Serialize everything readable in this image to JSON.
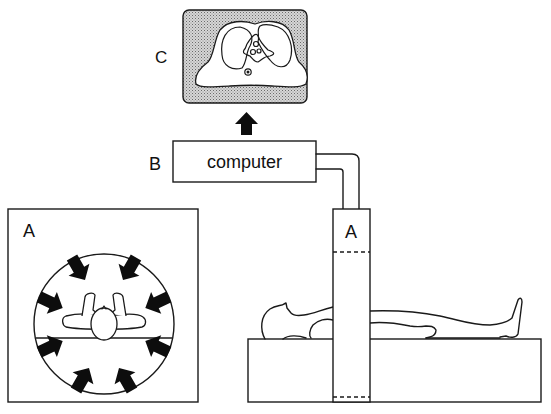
{
  "diagram": {
    "type": "CT scanner schematic",
    "labels": {
      "monitor": "C",
      "computer": "B",
      "gantry_cross_section": "A",
      "gantry_side": "A"
    },
    "computer_box_text": "computer",
    "components": [
      {
        "id": "A",
        "description": "Scanner gantry with X-ray source/detectors rotating around patient (cross-section and side view)"
      },
      {
        "id": "B",
        "description": "Computer receiving detector data"
      },
      {
        "id": "C",
        "description": "Monitor displaying reconstructed axial CT slice of chest"
      }
    ],
    "connections": [
      {
        "from": "A",
        "to": "B",
        "kind": "cable"
      },
      {
        "from": "B",
        "to": "C",
        "kind": "arrow"
      }
    ],
    "arrow_count_in_ring": 8,
    "colors": {
      "ink": "#1a1a1a",
      "background": "#ffffff",
      "monitor_shading": "#b8b8b8"
    }
  }
}
